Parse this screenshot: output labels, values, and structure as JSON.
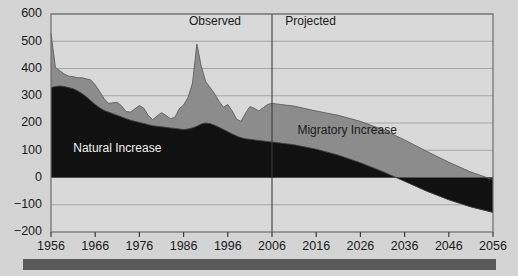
{
  "chart_data": {
    "type": "area",
    "stacked": true,
    "title": "",
    "subtitle": "",
    "xlabel": "",
    "ylabel": "",
    "xlim": [
      1956,
      2056
    ],
    "ylim": [
      -200,
      600
    ],
    "grid": true,
    "grid_axis": "y",
    "legend_position": "inline-annotation",
    "xticks": [
      1956,
      1966,
      1976,
      1986,
      1996,
      2006,
      2016,
      2026,
      2036,
      2046,
      2056
    ],
    "xtick_labels": [
      "1956",
      "1966",
      "1976",
      "1986",
      "1996",
      "2006",
      "2016",
      "2026",
      "2036",
      "2046",
      "2056"
    ],
    "yticks": [
      -200,
      -100,
      0,
      100,
      200,
      300,
      400,
      500,
      600
    ],
    "ytick_labels": [
      "−200",
      "−100",
      "0",
      "100",
      "200",
      "300",
      "400",
      "500",
      "600"
    ],
    "annotations": [
      {
        "name": "observed-label",
        "text": "Observed",
        "x": 1999,
        "y": 560,
        "align": "end"
      },
      {
        "name": "projected-label",
        "text": "Projected",
        "x": 2009,
        "y": 560,
        "align": "start"
      },
      {
        "name": "natural-increase-label",
        "text": "Natural Increase",
        "x": 1971,
        "y": 95,
        "align": "middle"
      },
      {
        "name": "migratory-increase-label",
        "text": "Migratory Increase",
        "x": 2023,
        "y": 160,
        "align": "middle"
      }
    ],
    "divider": {
      "name": "observed-projected-divider",
      "x": 2006,
      "label_left": "Observed",
      "label_right": "Projected"
    },
    "colors": {
      "natural_increase": "#111111",
      "migratory_increase": "#8c8c8c",
      "plot_background": "#d9d9d9",
      "page_background": "#d4d4d4",
      "grid": "#8f8f8f",
      "axis": "#4a4a4a",
      "bottom_bar": "#5a5a5a"
    },
    "series": [
      {
        "name": "Natural Increase",
        "color": "#111111",
        "x": [
          1956,
          1957,
          1958,
          1959,
          1960,
          1961,
          1962,
          1963,
          1964,
          1965,
          1966,
          1967,
          1968,
          1969,
          1970,
          1971,
          1972,
          1973,
          1974,
          1975,
          1976,
          1977,
          1978,
          1979,
          1980,
          1981,
          1982,
          1983,
          1984,
          1985,
          1986,
          1987,
          1988,
          1989,
          1990,
          1991,
          1992,
          1993,
          1994,
          1995,
          1996,
          1997,
          1998,
          1999,
          2000,
          2001,
          2002,
          2003,
          2004,
          2005,
          2006,
          2011,
          2016,
          2021,
          2026,
          2031,
          2036,
          2041,
          2046,
          2051,
          2056
        ],
        "values": [
          330,
          334,
          336,
          334,
          330,
          326,
          318,
          308,
          296,
          282,
          268,
          256,
          246,
          240,
          234,
          228,
          222,
          216,
          210,
          206,
          202,
          198,
          194,
          190,
          188,
          186,
          184,
          182,
          180,
          178,
          176,
          178,
          182,
          188,
          196,
          200,
          198,
          192,
          184,
          176,
          168,
          160,
          152,
          146,
          142,
          140,
          138,
          136,
          134,
          132,
          130,
          120,
          104,
          82,
          54,
          22,
          -14,
          -50,
          -82,
          -108,
          -128
        ]
      },
      {
        "name": "Migratory Increase",
        "color": "#8c8c8c",
        "x": [
          1956,
          1957,
          1958,
          1959,
          1960,
          1961,
          1962,
          1963,
          1964,
          1965,
          1966,
          1967,
          1968,
          1969,
          1970,
          1971,
          1972,
          1973,
          1974,
          1975,
          1976,
          1977,
          1978,
          1979,
          1980,
          1981,
          1982,
          1983,
          1984,
          1985,
          1986,
          1987,
          1988,
          1989,
          1990,
          1991,
          1992,
          1993,
          1994,
          1995,
          1996,
          1997,
          1998,
          1999,
          2000,
          2001,
          2002,
          2003,
          2004,
          2005,
          2006,
          2011,
          2016,
          2021,
          2026,
          2031,
          2036,
          2041,
          2046,
          2051,
          2056
        ],
        "values": [
          200,
          70,
          56,
          46,
          42,
          44,
          48,
          58,
          66,
          76,
          72,
          60,
          44,
          32,
          40,
          48,
          40,
          26,
          30,
          46,
          62,
          56,
          34,
          22,
          38,
          52,
          44,
          34,
          40,
          74,
          90,
          116,
          164,
          302,
          212,
          152,
          132,
          116,
          96,
          82,
          100,
          84,
          62,
          60,
          94,
          120,
          116,
          108,
          122,
          136,
          142,
          142,
          140,
          146,
          152,
          154,
          152,
          146,
          138,
          128,
          120
        ]
      }
    ],
    "totals": {
      "name": "Total Increase",
      "x": [
        1956,
        1966,
        1976,
        1986,
        1996,
        2006,
        2016,
        2026,
        2036,
        2046,
        2056
      ],
      "values": [
        530,
        340,
        264,
        266,
        268,
        272,
        244,
        206,
        138,
        56,
        -8
      ]
    }
  },
  "layout": {
    "plot": {
      "left": 51,
      "top": 14,
      "right": 493,
      "bottom": 232
    },
    "bottom_bar": {
      "left": 23,
      "top": 259,
      "width": 473,
      "height": 11
    }
  }
}
